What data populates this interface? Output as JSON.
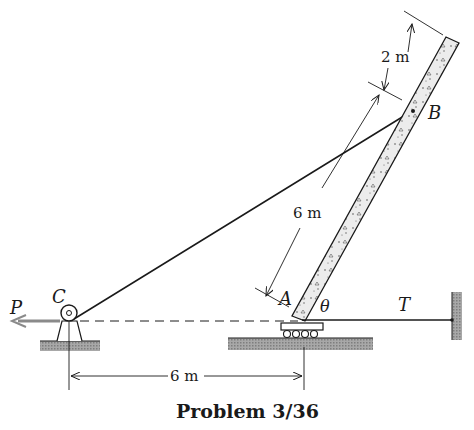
{
  "figure": {
    "caption": "Problem 3/36",
    "labels": {
      "force_P": "P",
      "pulley_C": "C",
      "base_A": "A",
      "point_B": "B",
      "angle": "θ",
      "tension_T": "T"
    },
    "dimensions": {
      "top_segment": "2 m",
      "pole_length_AB": "6 m",
      "horizontal_CA": "6 m"
    },
    "colors": {
      "line": "#1a1a1a",
      "ground_hatch": "#9a9a9a",
      "pole_fill": "#e6e6e6",
      "force_arrow": "#8a8a8a"
    }
  }
}
